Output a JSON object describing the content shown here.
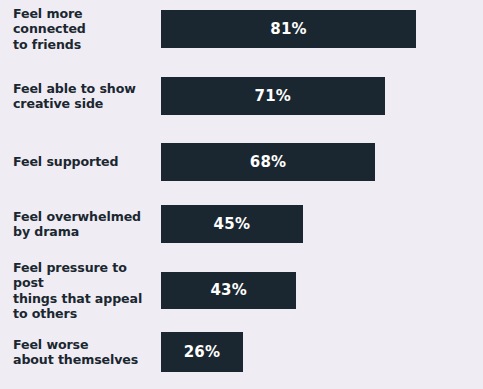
{
  "chart_data": {
    "type": "bar",
    "orientation": "horizontal",
    "title": "",
    "subtitle": "",
    "xlabel": "",
    "ylabel": "",
    "xlim": [
      0,
      100
    ],
    "grid": false,
    "legend": null,
    "value_suffix": "%",
    "categories": [
      "Feel more connected\nto friends",
      "Feel able to show\ncreative side",
      "Feel supported",
      "Feel overwhelmed\nby drama",
      "Feel pressure to post\nthings that appeal\nto others",
      "Feel worse\nabout themselves"
    ],
    "values": [
      81,
      71,
      68,
      45,
      43,
      26
    ],
    "value_labels": [
      "81%",
      "71%",
      "68%",
      "45%",
      "43%",
      "26%"
    ],
    "bars": [
      {
        "label": "Feel more connected\nto friends",
        "value": 81,
        "value_label": "81%"
      },
      {
        "label": "Feel able to show\ncreative side",
        "value": 71,
        "value_label": "71%"
      },
      {
        "label": "Feel supported",
        "value": 68,
        "value_label": "68%"
      },
      {
        "label": "Feel overwhelmed\nby drama",
        "value": 45,
        "value_label": "45%"
      },
      {
        "label": "Feel pressure to post\nthings that appeal\nto others",
        "value": 43,
        "value_label": "43%"
      },
      {
        "label": "Feel worse\nabout themselves",
        "value": 26,
        "value_label": "26%"
      }
    ],
    "colors": {
      "background": "#efedf3",
      "bar": "#1b2730",
      "label_text": "#1b2730",
      "value_text": "#ffffff"
    }
  },
  "layout": {
    "bar_origin_x": 161,
    "bar_max_width": 315,
    "bar_height": 38,
    "rows_y": [
      10,
      77,
      143,
      205,
      272,
      332
    ],
    "rows_height": [
      38,
      38,
      38,
      38,
      37,
      40
    ]
  }
}
